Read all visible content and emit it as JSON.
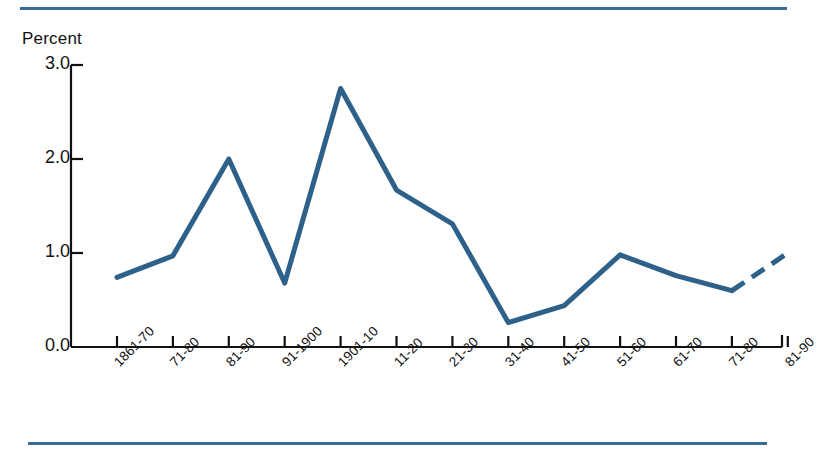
{
  "rules": {
    "color": "#3a6a96",
    "top_label": "top-divider",
    "bottom_label": "bottom-divider"
  },
  "chart_data": {
    "type": "line",
    "title": "",
    "subtitle": "",
    "xlabel": "",
    "ylabel": "Percent",
    "categories": [
      "1861-70",
      "71-80",
      "81-90",
      "91-1900",
      "1901-10",
      "11-20",
      "21-30",
      "31-40",
      "41-50",
      "51-60",
      "61-70",
      "71-80",
      "81-90"
    ],
    "values": [
      0.74,
      0.97,
      2.0,
      0.68,
      2.75,
      1.67,
      1.31,
      0.26,
      0.44,
      0.98,
      0.76,
      0.6,
      1.0
    ],
    "ylim": [
      0.0,
      3.0
    ],
    "ytick_labels": [
      "0.0",
      "1.0",
      "2.0",
      "3.0"
    ],
    "ytick_values": [
      0.0,
      1.0,
      2.0,
      3.0
    ],
    "grid": false,
    "legend": null,
    "series": [
      {
        "name": "Percent",
        "color": "#2e6189",
        "values": [
          0.74,
          0.97,
          2.0,
          0.68,
          2.75,
          1.67,
          1.31,
          0.26,
          0.44,
          0.98,
          0.76,
          0.6,
          1.0
        ],
        "dashed_from_index": 11,
        "dashed_note": "final segment drawn dashed"
      }
    ]
  }
}
